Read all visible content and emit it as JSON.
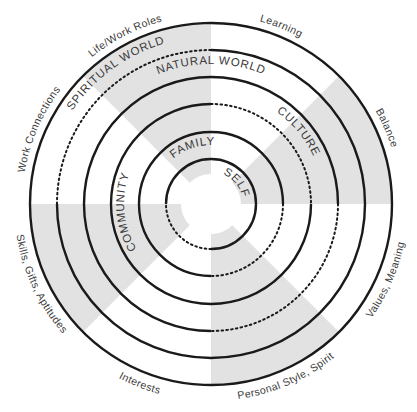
{
  "diagram": {
    "center": {
      "x": 211,
      "y": 204
    },
    "colors": {
      "stroke": "#1a1a1a",
      "shade": "#e2e2e2",
      "text": "#3a3a3a",
      "background": "#ffffff"
    },
    "rings": [
      {
        "name": "SELF",
        "radius": 45,
        "dotted_from": 90,
        "dotted_to": 180
      },
      {
        "name": "FAMILY",
        "radius": 72,
        "dotted_from": 0,
        "dotted_to": 90
      },
      {
        "name": "COMMUNITY",
        "radius": 100,
        "dotted_from": 270,
        "dotted_to": 360
      },
      {
        "name": "CULTURE",
        "radius": 127,
        "dotted_from": 0,
        "dotted_to": 90
      },
      {
        "name": "NATURAL WORLD",
        "radius": 154,
        "dotted_from": 180,
        "dotted_to": 270
      },
      {
        "name": "SPIRITUAL WORLD",
        "radius": 181,
        "dotted_from": null,
        "dotted_to": null
      }
    ],
    "shaded_wedges": [
      {
        "from": 225,
        "to": 270
      },
      {
        "from": 315,
        "to": 360
      },
      {
        "from": 135,
        "to": 180
      },
      {
        "from": 45,
        "to": 90
      }
    ],
    "inner_labels": {
      "self": "SELF",
      "family": "FAMILY",
      "community": "COMMUNITY",
      "culture": "CULTURE",
      "natural_world": "NATURAL WORLD",
      "spiritual_world": "SPIRITUAL WORLD"
    },
    "outer_labels": {
      "life_work_roles": "Life/Work Roles",
      "learning": "Learning",
      "balance": "Balance",
      "values_meaning": "Values, Meaning",
      "personal_style_spirit": "Personal Style, Spirit",
      "interests": "Interests",
      "skills_gifts_aptitudes": "Skills, Gifts, Aptitudes",
      "work_connections": "Work Connections"
    }
  }
}
